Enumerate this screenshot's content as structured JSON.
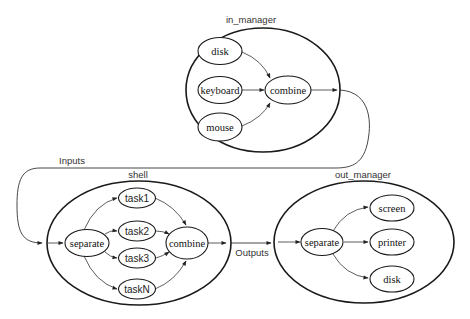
{
  "in_manager": {
    "title": "in_manager",
    "nodes": {
      "disk": "disk",
      "keyboard": "keyboard",
      "mouse": "mouse",
      "combine": "combine"
    }
  },
  "connectors": {
    "inputs": "Inputs",
    "outputs": "Outputs"
  },
  "shell": {
    "title": "shell",
    "nodes": {
      "separate": "separate",
      "task1": "task1",
      "task2": "task2",
      "task3": "task3",
      "taskN": "taskN",
      "combine": "combine"
    }
  },
  "out_manager": {
    "title": "out_manager",
    "nodes": {
      "separate": "separate",
      "screen": "screen",
      "printer": "printer",
      "disk": "disk"
    }
  },
  "colors": {
    "stroke": "#1a1a1a",
    "background": "#ffffff"
  }
}
